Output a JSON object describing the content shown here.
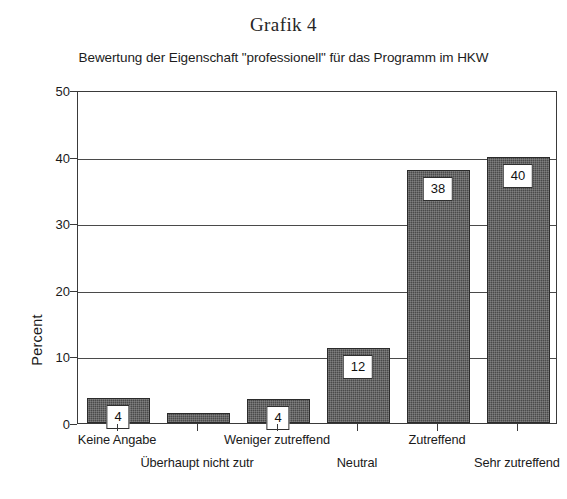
{
  "chart_data": {
    "type": "bar",
    "title": "Grafik 4",
    "subtitle": "Bewertung der Eigenschaft \"professionell\" für das Programm im HKW",
    "xlabel": "",
    "ylabel": "Percent",
    "ylim": [
      0,
      50
    ],
    "yticks": [
      0,
      10,
      20,
      30,
      40,
      50
    ],
    "grid": true,
    "legend": null,
    "categories": [
      "Keine Angabe",
      "Überhaupt nicht zutr",
      "Weniger zutreffend",
      "Neutral",
      "Zutreffend",
      "Sehr zutreffend"
    ],
    "values": [
      3.7,
      1.5,
      3.6,
      11.3,
      38,
      40
    ],
    "data_labels": [
      "4",
      "",
      "4",
      "12",
      "38",
      "40"
    ]
  },
  "axis": {
    "y_tick_labels": [
      "0",
      "10",
      "20",
      "30",
      "40",
      "50"
    ],
    "y_title": "Percent"
  }
}
